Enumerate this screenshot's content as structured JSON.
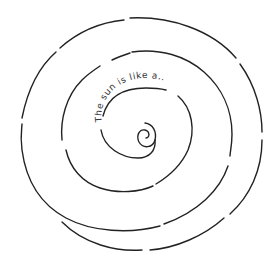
{
  "drawing": {
    "type": "hand-drawn spiral",
    "text": "The sun is like a..",
    "stroke_color": "#222222",
    "background": "#ffffff"
  }
}
